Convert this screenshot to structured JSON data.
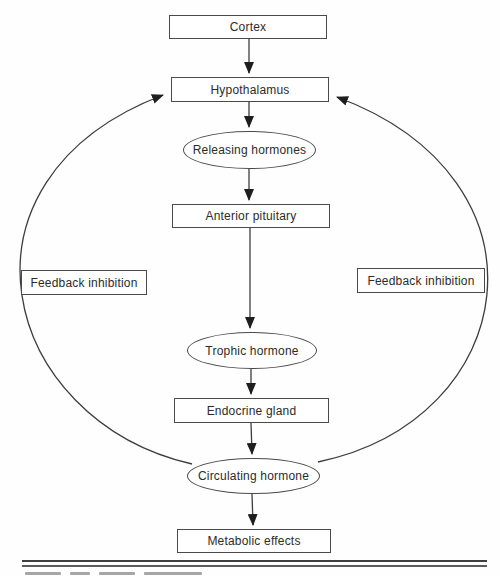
{
  "diagram": {
    "type": "flowchart",
    "nodes": [
      {
        "id": "cortex",
        "label": "Cortex",
        "shape": "rect"
      },
      {
        "id": "hypothalamus",
        "label": "Hypothalamus",
        "shape": "rect"
      },
      {
        "id": "releasing-hormones",
        "label": "Releasing hormones",
        "shape": "ellipse"
      },
      {
        "id": "anterior-pituitary",
        "label": "Anterior pituitary",
        "shape": "rect"
      },
      {
        "id": "trophic-hormone",
        "label": "Trophic hormone",
        "shape": "ellipse"
      },
      {
        "id": "endocrine-gland",
        "label": "Endocrine gland",
        "shape": "rect"
      },
      {
        "id": "circulating-hormone",
        "label": "Circulating hormone",
        "shape": "ellipse"
      },
      {
        "id": "metabolic-effects",
        "label": "Metabolic effects",
        "shape": "rect"
      }
    ],
    "feedback": {
      "left_label": "Feedback inhibition",
      "right_label": "Feedback inhibition"
    },
    "edges": [
      {
        "from": "Cortex",
        "to": "Hypothalamus"
      },
      {
        "from": "Hypothalamus",
        "to": "Releasing hormones"
      },
      {
        "from": "Releasing hormones",
        "to": "Anterior pituitary"
      },
      {
        "from": "Anterior pituitary",
        "to": "Trophic hormone"
      },
      {
        "from": "Trophic hormone",
        "to": "Endocrine gland"
      },
      {
        "from": "Endocrine gland",
        "to": "Circulating hormone"
      },
      {
        "from": "Circulating hormone",
        "to": "Metabolic effects"
      },
      {
        "from": "Circulating hormone",
        "to": "Hypothalamus",
        "via": "left feedback-inhibition arc"
      },
      {
        "from": "Circulating hormone",
        "to": "Hypothalamus",
        "via": "right feedback-inhibition arc"
      }
    ],
    "colors": {
      "line": "#3d3d3d",
      "arrowhead": "#1e1e1e",
      "node_border": "#4a4a4a",
      "node_fill": "#ffffff",
      "text": "#2b2b2b",
      "background": "#fefefe"
    }
  }
}
